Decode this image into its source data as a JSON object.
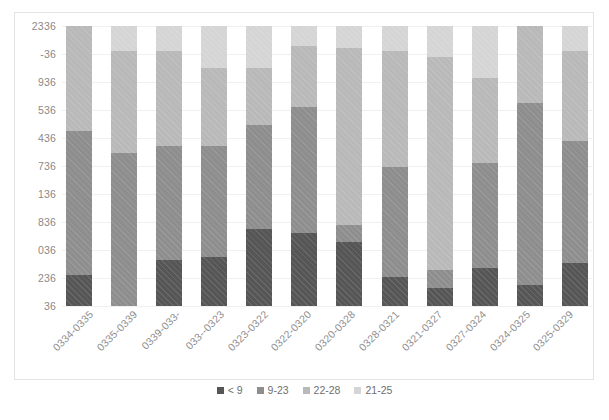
{
  "chart_data": {
    "type": "bar",
    "stacked": true,
    "stack_mode": "percent",
    "title": "",
    "subtitle": "",
    "xlabel": "",
    "ylabel": "",
    "grid": true,
    "legend_position": "bottom",
    "orientation": "vertical",
    "ylim": [
      0,
      100
    ],
    "y_tick_labels": [
      "2336",
      "-36",
      "936",
      "536",
      "436",
      "736",
      "136",
      "836",
      "036",
      "236",
      "36"
    ],
    "categories": [
      "0334-0335",
      "0335-0339",
      "0339-033-",
      "033--0323",
      "0323-0322",
      "0322-0320",
      "0320-0328",
      "0328-0321",
      "0321-0327",
      "0327-0324",
      "0324-0325",
      "0325-0329"
    ],
    "series": [
      {
        "name": "< 9",
        "color": "#565656",
        "values": [
          11.0,
          0.0,
          16.5,
          17.5,
          27.5,
          26.0,
          23.0,
          10.5,
          6.5,
          13.5,
          7.5,
          15.5
        ]
      },
      {
        "name": "9-23",
        "color": "#8e8e8e",
        "values": [
          51.5,
          54.5,
          40.5,
          39.5,
          37.0,
          45.0,
          6.0,
          39.0,
          6.5,
          37.5,
          65.0,
          43.5
        ]
      },
      {
        "name": "22-28",
        "color": "#b9b9b9",
        "values": [
          37.5,
          36.5,
          34.0,
          28.0,
          20.5,
          22.0,
          63.0,
          41.5,
          76.0,
          30.5,
          27.5,
          32.0
        ]
      },
      {
        "name": "21-25",
        "color": "#d5d5d5",
        "values": [
          0.0,
          9.0,
          9.0,
          15.0,
          15.0,
          7.0,
          8.0,
          9.0,
          11.0,
          18.5,
          0.0,
          9.0
        ]
      }
    ]
  },
  "legend": {
    "items": [
      {
        "label": "< 9",
        "color": "#565656"
      },
      {
        "label": "9-23",
        "color": "#8e8e8e"
      },
      {
        "label": "22-28",
        "color": "#b9b9b9"
      },
      {
        "label": "21-25",
        "color": "#d5d5d5"
      }
    ]
  }
}
